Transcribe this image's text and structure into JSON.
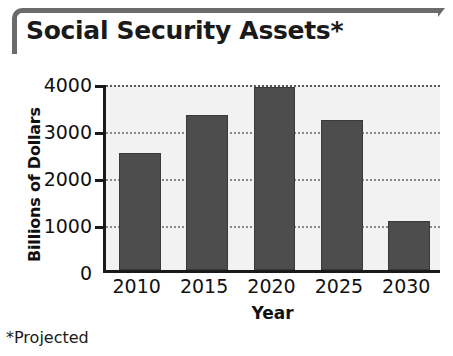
{
  "title": "Social Security Assets*",
  "footnote": "*Projected",
  "chart_data": {
    "type": "bar",
    "title": "Social Security Assets*",
    "xlabel": "Year",
    "ylabel": "Billions of Dollars",
    "categories": [
      "2010",
      "2015",
      "2020",
      "2025",
      "2030"
    ],
    "values": [
      2500,
      3300,
      3900,
      3200,
      1050
    ],
    "ylim": [
      0,
      4000
    ],
    "ytick_labels": [
      "4000",
      "3000",
      "2000",
      "1000",
      "0"
    ],
    "yticks": [
      4000,
      3000,
      2000,
      1000,
      0
    ],
    "grid": true,
    "grid_style": "dotted-horizontal",
    "legend": false,
    "annotations": [
      "*Projected"
    ],
    "colors": {
      "bar_fill": "#4d4d4d",
      "plot_background": "#f2f2f2",
      "axis": "#1a1a1a",
      "gridline": "#8a8a8a",
      "title_rule": "#6b6b6b",
      "text": "#111111"
    }
  }
}
